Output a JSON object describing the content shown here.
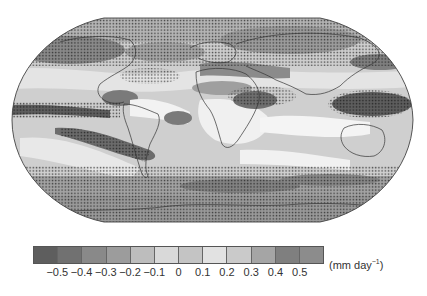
{
  "figure": {
    "projection": "Robinson",
    "colors": {
      "land_outline": "#333333",
      "stipple": "#1a1a1a",
      "background": "#ffffff"
    }
  },
  "colorbar": {
    "units_main": "(mm day",
    "units_sup": "−1",
    "units_close": ")",
    "boxes": [
      {
        "color": "#5e5e5e"
      },
      {
        "color": "#717171"
      },
      {
        "color": "#898989"
      },
      {
        "color": "#9c9c9c"
      },
      {
        "color": "#bdbdbd"
      },
      {
        "color": "#d9d9d9"
      },
      {
        "color": "#c4c4c4"
      },
      {
        "color": "#e2e2e2"
      },
      {
        "color": "#cacaca"
      },
      {
        "color": "#a5a5a5"
      },
      {
        "color": "#7f7f7f"
      },
      {
        "color": "#8c8c8c"
      }
    ],
    "ticks": [
      "−0.5",
      "−0.4",
      "−0.3",
      "−0.2",
      "−0.1",
      "0",
      "0.1",
      "0.2",
      "0.3",
      "0.4",
      "0.5"
    ]
  }
}
